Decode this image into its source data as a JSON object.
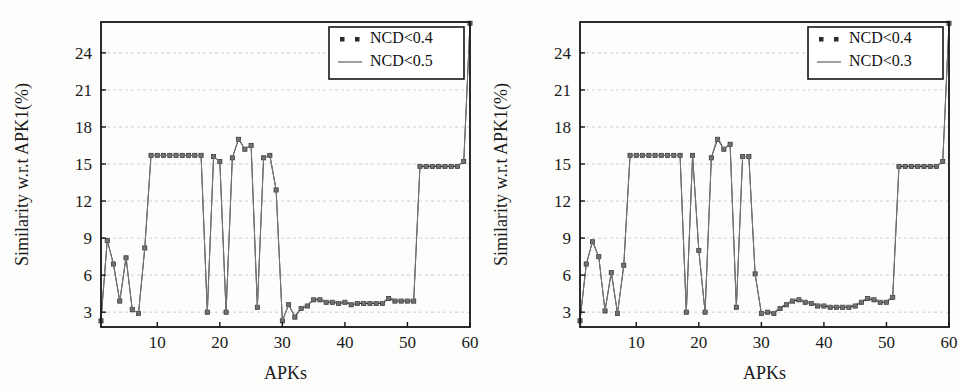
{
  "figure": {
    "background_color": "#fdfdfc",
    "panels": [
      {
        "id": "left-panel",
        "name": "similarity-chart-ncd-0-5",
        "xlabel": "APKs",
        "ylabel": "Similarity w.r.t APK1(%)",
        "legend": [
          {
            "label": "NCD<0.4",
            "style": "dotted-marker",
            "color": "#2b2b2b"
          },
          {
            "label": "NCD<0.5",
            "style": "solid-line",
            "color": "#777777"
          }
        ],
        "xticks": [
          "10",
          "20",
          "30",
          "40",
          "50",
          "60"
        ],
        "yticks": [
          "3",
          "6",
          "9",
          "12",
          "15",
          "18",
          "21",
          "24"
        ]
      },
      {
        "id": "right-panel",
        "name": "similarity-chart-ncd-0-3",
        "xlabel": "APKs",
        "ylabel": "Similarity w.r.t APK1(%)",
        "legend": [
          {
            "label": "NCD<0.4",
            "style": "dotted-marker",
            "color": "#2b2b2b"
          },
          {
            "label": "NCD<0.3",
            "style": "solid-line",
            "color": "#777777"
          }
        ],
        "xticks": [
          "10",
          "20",
          "30",
          "40",
          "50",
          "60"
        ],
        "yticks": [
          "3",
          "6",
          "9",
          "12",
          "15",
          "18",
          "21",
          "24"
        ]
      }
    ]
  },
  "chart_data": [
    {
      "type": "line",
      "id": "left",
      "title": "",
      "xlabel": "APKs",
      "ylabel": "Similarity w.r.t APK1(%)",
      "xlim": [
        1,
        60
      ],
      "ylim": [
        1.8,
        26.5
      ],
      "xticks": [
        10,
        20,
        30,
        40,
        50,
        60
      ],
      "yticks": [
        3,
        6,
        9,
        12,
        15,
        18,
        21,
        24
      ],
      "grid": true,
      "legend_position": "top-right",
      "x": [
        1,
        2,
        3,
        4,
        5,
        6,
        7,
        8,
        9,
        10,
        11,
        12,
        13,
        14,
        15,
        16,
        17,
        18,
        19,
        20,
        21,
        22,
        23,
        24,
        25,
        26,
        27,
        28,
        29,
        30,
        31,
        32,
        33,
        34,
        35,
        36,
        37,
        38,
        39,
        40,
        41,
        42,
        43,
        44,
        45,
        46,
        47,
        48,
        49,
        50,
        51,
        52,
        53,
        54,
        55,
        56,
        57,
        58,
        59,
        60
      ],
      "series": [
        {
          "name": "NCD<0.4",
          "marker": "square",
          "color": "#2b2b2b",
          "values": [
            2.3,
            8.8,
            6.9,
            3.9,
            7.4,
            3.2,
            2.9,
            8.2,
            15.7,
            15.7,
            15.7,
            15.7,
            15.7,
            15.7,
            15.7,
            15.7,
            15.7,
            3.0,
            15.6,
            15.2,
            3.0,
            15.5,
            17.0,
            16.2,
            16.5,
            3.4,
            15.5,
            15.7,
            12.9,
            2.3,
            3.6,
            2.6,
            3.3,
            3.5,
            4.0,
            4.0,
            3.8,
            3.8,
            3.7,
            3.8,
            3.6,
            3.7,
            3.7,
            3.7,
            3.7,
            3.7,
            4.1,
            3.9,
            3.9,
            3.9,
            3.9,
            14.8,
            14.8,
            14.8,
            14.8,
            14.8,
            14.8,
            14.8,
            15.2,
            26.4
          ]
        },
        {
          "name": "NCD<0.5",
          "marker": "none",
          "color": "#777777",
          "values": [
            2.4,
            8.9,
            6.8,
            3.9,
            7.5,
            3.2,
            2.9,
            8.2,
            15.7,
            15.7,
            15.7,
            15.7,
            15.7,
            15.7,
            15.7,
            15.7,
            15.7,
            3.0,
            15.6,
            15.2,
            3.0,
            15.5,
            17.1,
            16.2,
            16.6,
            3.4,
            15.5,
            15.7,
            12.9,
            2.3,
            3.6,
            2.7,
            3.4,
            3.6,
            4.1,
            4.1,
            3.9,
            3.9,
            3.8,
            3.9,
            3.7,
            3.8,
            3.8,
            3.8,
            3.8,
            3.8,
            4.2,
            4.0,
            4.0,
            4.0,
            4.0,
            14.9,
            14.9,
            14.9,
            14.9,
            14.9,
            14.9,
            14.9,
            15.2,
            26.4
          ]
        }
      ]
    },
    {
      "type": "line",
      "id": "right",
      "title": "",
      "xlabel": "APKs",
      "ylabel": "Similarity w.r.t APK1(%)",
      "xlim": [
        1,
        60
      ],
      "ylim": [
        1.8,
        26.5
      ],
      "xticks": [
        10,
        20,
        30,
        40,
        50,
        60
      ],
      "yticks": [
        3,
        6,
        9,
        12,
        15,
        18,
        21,
        24
      ],
      "grid": true,
      "legend_position": "top-right",
      "x": [
        1,
        2,
        3,
        4,
        5,
        6,
        7,
        8,
        9,
        10,
        11,
        12,
        13,
        14,
        15,
        16,
        17,
        18,
        19,
        20,
        21,
        22,
        23,
        24,
        25,
        26,
        27,
        28,
        29,
        30,
        31,
        32,
        33,
        34,
        35,
        36,
        37,
        38,
        39,
        40,
        41,
        42,
        43,
        44,
        45,
        46,
        47,
        48,
        49,
        50,
        51,
        52,
        53,
        54,
        55,
        56,
        57,
        58,
        59,
        60
      ],
      "series": [
        {
          "name": "NCD<0.4",
          "marker": "square",
          "color": "#2b2b2b",
          "values": [
            2.3,
            6.9,
            8.7,
            7.5,
            3.1,
            6.2,
            2.9,
            6.8,
            15.7,
            15.7,
            15.7,
            15.7,
            15.7,
            15.7,
            15.7,
            15.7,
            15.7,
            3.0,
            15.7,
            8.0,
            3.0,
            15.5,
            17.0,
            16.2,
            16.6,
            3.4,
            15.6,
            15.6,
            6.1,
            2.9,
            3.0,
            2.9,
            3.3,
            3.6,
            3.9,
            4.0,
            3.8,
            3.7,
            3.5,
            3.5,
            3.4,
            3.4,
            3.4,
            3.4,
            3.5,
            3.8,
            4.1,
            4.0,
            3.8,
            3.8,
            4.2,
            14.8,
            14.8,
            14.8,
            14.8,
            14.8,
            14.8,
            14.8,
            15.2,
            26.4
          ]
        },
        {
          "name": "NCD<0.3",
          "marker": "none",
          "color": "#777777",
          "values": [
            2.4,
            6.8,
            8.8,
            7.5,
            3.1,
            6.3,
            2.9,
            6.8,
            15.7,
            15.7,
            15.7,
            15.7,
            15.7,
            15.7,
            15.7,
            15.7,
            15.7,
            3.0,
            15.7,
            8.0,
            3.0,
            15.5,
            17.2,
            16.2,
            16.7,
            3.4,
            15.6,
            15.6,
            6.1,
            2.9,
            3.1,
            3.0,
            3.4,
            3.7,
            4.0,
            4.1,
            3.9,
            3.8,
            3.6,
            3.6,
            3.5,
            3.5,
            3.5,
            3.5,
            3.6,
            3.9,
            4.2,
            4.1,
            3.9,
            3.9,
            4.3,
            14.9,
            14.9,
            14.9,
            14.9,
            14.9,
            14.9,
            14.9,
            15.2,
            26.4
          ]
        }
      ]
    }
  ]
}
